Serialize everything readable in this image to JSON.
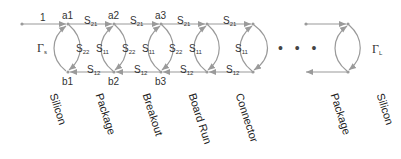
{
  "diagram": {
    "title": "",
    "type": "signal-flow-graph",
    "colors": {
      "line": "#9a9a9a",
      "text": "#333333",
      "background": "#ffffff"
    },
    "input_label": "1",
    "source_reflection": {
      "symbol": "Γ",
      "sub": "s"
    },
    "load_reflection": {
      "symbol": "Γ",
      "sub": "L"
    },
    "node_labels": {
      "top": [
        "a1",
        "a2",
        "a3"
      ],
      "bottom": [
        "b1",
        "b2",
        "b3"
      ]
    },
    "forward_labels": [
      {
        "s": "S",
        "sub": "21"
      },
      {
        "s": "S",
        "sub": "21"
      },
      {
        "s": "S",
        "sub": "21"
      },
      {
        "s": "S",
        "sub": "21"
      }
    ],
    "reverse_labels": [
      {
        "s": "S",
        "sub": "12"
      },
      {
        "s": "S",
        "sub": "12"
      },
      {
        "s": "S",
        "sub": "12"
      },
      {
        "s": "S",
        "sub": "12"
      }
    ],
    "s11_labels": [
      {
        "s": "S",
        "sub": "11"
      },
      {
        "s": "S",
        "sub": "11"
      },
      {
        "s": "S",
        "sub": "11"
      },
      {
        "s": "S",
        "sub": "11"
      }
    ],
    "s22_labels": [
      {
        "s": "S",
        "sub": "22"
      },
      {
        "s": "S",
        "sub": "22"
      },
      {
        "s": "S",
        "sub": "22"
      }
    ],
    "ellipsis": "• • •",
    "segments": [
      "Silicon",
      "Package",
      "Breakout",
      "Board Run",
      "Connector",
      "Package",
      "Silicon"
    ]
  }
}
